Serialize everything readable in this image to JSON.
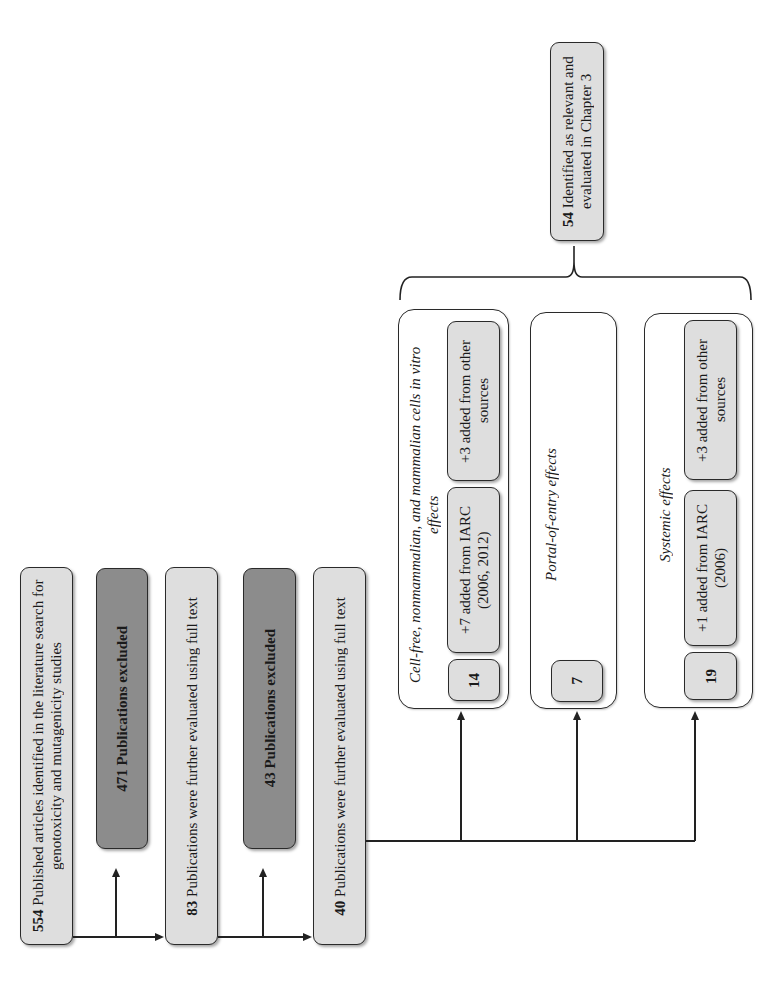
{
  "flowchart": {
    "orientation": "rotated 90deg counter-clockwise",
    "steps": [
      {
        "count": "554",
        "text": " Published articles identified in the literature search for genotoxicity and mutagenicity studies"
      },
      {
        "count": "471",
        "text": " Publications excluded"
      },
      {
        "count": "83",
        "text": " Publications were further evaluated using full text"
      },
      {
        "count": "43",
        "text": " Publications excluded"
      },
      {
        "count": "40",
        "text": " Publications were further evaluated using full text"
      }
    ],
    "groups": [
      {
        "title": "Cell-free, nonmammalian, and mammalian cells in vitro effects",
        "count": "14",
        "added_iarc": "+7 added from IARC (2006, 2012)",
        "added_other": "+3 added from other sources"
      },
      {
        "title": "Portal-of-entry effects",
        "count": "7"
      },
      {
        "title": "Systemic effects",
        "count": "19",
        "added_iarc": "+1 added from IARC (2006)",
        "added_other": "+3 added from other sources"
      }
    ],
    "final": {
      "count": "54",
      "text": " Identified as relevant and evaluated in Chapter 3"
    }
  },
  "colors": {
    "light_box": "#dedede",
    "excluded_box": "#8c8c8c",
    "line": "#222222"
  }
}
